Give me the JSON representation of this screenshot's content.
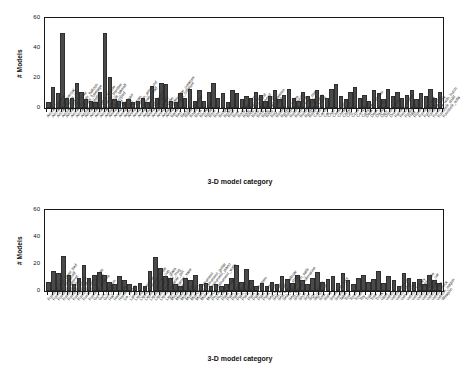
{
  "figure": {
    "background": "#ffffff",
    "bar_color": "#4a4a4a",
    "axis_color": "#1a1a1a"
  },
  "chart_data": [
    {
      "type": "bar",
      "title": "",
      "xlabel": "3-D model category",
      "ylabel": "# Models",
      "ylim": [
        0,
        60
      ],
      "yticks": [
        0,
        20,
        40,
        60
      ],
      "grid": false,
      "legend": "none",
      "categories": [
        "Aircraft_biplane",
        "Aircraft_commercial",
        "Aircraft_fighter_jet",
        "Aircraft_glider",
        "Aircraft_helicopter",
        "Aircraft_hot_air_balloon",
        "Aircraft_multi_fuselage",
        "Aircraft_propeller",
        "Aircraft_rocket",
        "Aircraft_space_shuttle",
        "Aircraft_stealth_bomber",
        "Aircraft_vertical_takeoff",
        "Animal_arthropod",
        "Animal_bird",
        "Animal_dinosaur",
        "Animal_fish",
        "Animal_human",
        "Animal_human_arms_out",
        "Animal_human_head",
        "Animal_insect",
        "Animal_quadruped",
        "Animal_reptile",
        "Animal_snake",
        "Animal_spider",
        "Animal_underwater_creature",
        "Animal_winged_creature",
        "Barrel",
        "Bed",
        "Bench",
        "Blade_weapon",
        "Board",
        "Book",
        "Bookshelf",
        "Bottle",
        "Bowl",
        "Box",
        "Bridge",
        "Brush",
        "Bush",
        "Bust",
        "Body_part_arm",
        "Body_part_face",
        "Body_part_hand",
        "Body_part_head",
        "Body_part_leg",
        "Body_part_skeleton",
        "Body_position",
        "Bug",
        "Building",
        "Building_castle",
        "Building_church",
        "Building_dome",
        "Building_high_rise",
        "Building_home",
        "Building_temple",
        "Building_tower",
        "Cabinet",
        "Candle",
        "Car",
        "Chair",
        "Chess_piece",
        "Chess_set",
        "Chest",
        "City",
        "Clock",
        "Computer",
        "Computer_monitor",
        "Desk",
        "Desk_lamp",
        "Display",
        "Door",
        "Double_door",
        "Drum",
        "Fantasy_animal",
        "Fence",
        "Fireplace",
        "Flag",
        "Flower",
        "Furniture_bed",
        "Furniture_chair",
        "Furniture_desk",
        "Furniture_with_hutch",
        "Furniture_shelf",
        "Furniture_sofa",
        "Furniture_table",
        "Furniture_wardrobe"
      ],
      "values": [
        4,
        14,
        10,
        50,
        7,
        7,
        17,
        11,
        6,
        5,
        4,
        11,
        50,
        21,
        6,
        5,
        4,
        6,
        4,
        5,
        7,
        4,
        15,
        7,
        17,
        16,
        5,
        4,
        10,
        7,
        13,
        5,
        12,
        5,
        11,
        17,
        7,
        10,
        4,
        12,
        10,
        6,
        8,
        7,
        11,
        9,
        5,
        8,
        12,
        6,
        9,
        13,
        7,
        5,
        11,
        8,
        6,
        12,
        9,
        7,
        13,
        16,
        8,
        6,
        11,
        14,
        7,
        9,
        5,
        12,
        10,
        6,
        13,
        8,
        11,
        7,
        9,
        12,
        6,
        10,
        8,
        13,
        7,
        11
      ]
    },
    {
      "type": "bar",
      "title": "",
      "xlabel": "3-D model category",
      "ylabel": "# Models",
      "ylim": [
        0,
        60
      ],
      "yticks": [
        0,
        20,
        40,
        60
      ],
      "grid": false,
      "legend": "none",
      "categories": [
        "Furniture_bed_chest_bed",
        "Furniture_bookshelf",
        "Furniture_cabinet",
        "Furniture_chair",
        "Furniture_couch",
        "Furniture_desk",
        "Furniture_dining_chair",
        "Furniture_kit_chair",
        "Furniture_shelves",
        "Gun",
        "Gun_handgun",
        "Gun_rifle",
        "Hat",
        "Helicopter",
        "Home",
        "Ice_cream",
        "Lamp",
        "Liquid_container",
        "Liquid_container_bottle",
        "Liquid_container_cup",
        "Liquid_container_glass",
        "Liquid_container_mug",
        "Liquid_container_pot",
        "Liquid_container_vase",
        "Microscope",
        "Missile",
        "Motorcycle",
        "Mushroom",
        "Musical_instrument",
        "Musical_instrument_guitar",
        "Musical_instrument_piano",
        "Musical_instrument_violin",
        "Phone",
        "Phone_cellular",
        "Plant",
        "Plant_bush",
        "Plant_flower",
        "Plant_potted",
        "Plant_tree",
        "Plant_with_stem",
        "Plate",
        "Plant_indoor",
        "Plant_palm",
        "Sea_vessel",
        "Sea_vessel_sailboat",
        "Sea_vessel_ship",
        "Sea_vessel_with_sails",
        "Sea_vessel_submarine",
        "Shelf",
        "Shoe",
        "Sign",
        "Sign_symbol",
        "Skyscraper",
        "Sofa",
        "Stairs",
        "Swimming_pool",
        "Sword",
        "Table",
        "Tool",
        "Torch",
        "Tower",
        "Toy",
        "Train",
        "Tree",
        "Truck",
        "Vase",
        "Vehicle",
        "Vehicle_bicycle",
        "Vehicle_bus",
        "Vehicle_car",
        "Vehicle_military",
        "Vehicle_motorcycle",
        "Vehicle_sports_car",
        "Vehicle_tank",
        "Vehicle_train",
        "Vehicle_truck",
        "Vehicle_wagon",
        "Weapon",
        "Wheel"
      ],
      "values": [
        7,
        15,
        13,
        26,
        12,
        5,
        10,
        19,
        10,
        12,
        14,
        12,
        7,
        5,
        11,
        8,
        5,
        4,
        6,
        4,
        15,
        25,
        17,
        11,
        10,
        5,
        4,
        10,
        8,
        12,
        5,
        6,
        4,
        5,
        4,
        5,
        10,
        19,
        7,
        16,
        8,
        4,
        6,
        4,
        7,
        5,
        11,
        9,
        6,
        12,
        8,
        5,
        10,
        14,
        7,
        9,
        11,
        6,
        13,
        8,
        5,
        10,
        12,
        7,
        9,
        15,
        6,
        11,
        8,
        4,
        13,
        10,
        7,
        9,
        5,
        12,
        8,
        6
      ]
    }
  ]
}
